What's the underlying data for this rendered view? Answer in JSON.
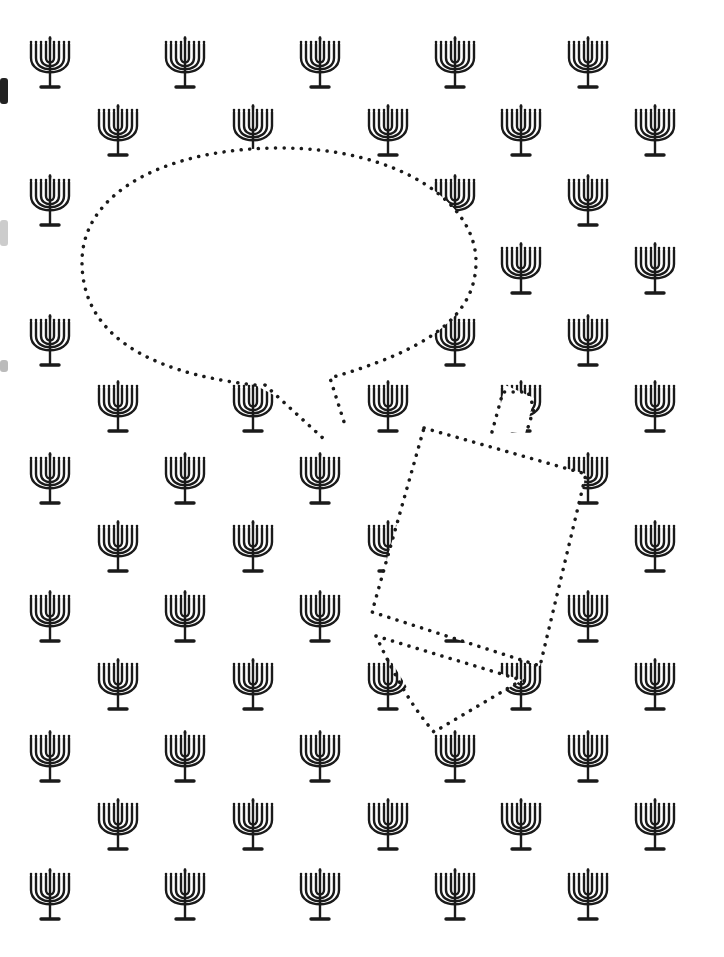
{
  "page": {
    "title": "Hanukkah menorah pattern worksheet",
    "background_color": "#ffffff",
    "ink_color": "#1a1a1a"
  },
  "pattern": {
    "motif": "menorah-icon",
    "branches": 9,
    "row_a_x": [
      50,
      185,
      320,
      455,
      588
    ],
    "row_b_x": [
      118,
      253,
      388,
      521,
      655
    ],
    "row_a_y": [
      12,
      150,
      290,
      428,
      566,
      706,
      844
    ],
    "row_b_y": [
      80,
      218,
      356,
      496,
      634,
      774
    ]
  },
  "shapes": {
    "speech_bubble": {
      "label": "blank speech bubble",
      "style": "dotted outline",
      "fill": "white"
    },
    "dreidel": {
      "label": "blank dreidel outline",
      "style": "dotted outline",
      "fill": "white"
    }
  }
}
